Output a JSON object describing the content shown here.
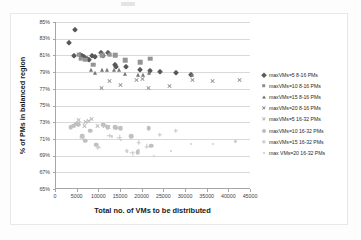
{
  "chart_data": {
    "type": "scatter",
    "title": "",
    "xlabel": "Total no. of VMs to be distributed",
    "ylabel": "% of PMs in balanced region",
    "xlim": [
      0,
      45000
    ],
    "ylim": [
      0.65,
      0.85
    ],
    "xticks": [
      "0",
      "5000",
      "10000",
      "15000",
      "20000",
      "25000",
      "30000",
      "35000",
      "40000",
      "45000"
    ],
    "yticks": [
      "65%",
      "67%",
      "69%",
      "71%",
      "73%",
      "75%",
      "77%",
      "79%",
      "81%",
      "83%",
      "85%"
    ],
    "grid": "horizontal",
    "legend_position": "right",
    "series": [
      {
        "name": "maxVMs=5 8-16 PMs",
        "marker": "diamond",
        "color": "#585858",
        "points": [
          [
            2900,
            82.5
          ],
          [
            4400,
            84.0
          ],
          [
            4100,
            80.9
          ],
          [
            5600,
            81.0
          ],
          [
            6000,
            80.9
          ],
          [
            6400,
            80.8
          ],
          [
            7100,
            80.6
          ],
          [
            7600,
            80.5
          ],
          [
            8400,
            80.9
          ],
          [
            9000,
            80.8
          ],
          [
            10400,
            81.3
          ],
          [
            10900,
            80.9
          ],
          [
            11900,
            81.3
          ],
          [
            13600,
            79.9
          ],
          [
            13900,
            79.6
          ],
          [
            16100,
            79.6
          ],
          [
            19400,
            79.3
          ],
          [
            21600,
            79.1
          ],
          [
            23900,
            79.0
          ],
          [
            27800,
            78.9
          ],
          [
            31200,
            78.7
          ]
        ]
      },
      {
        "name": "maxVMs=10 8-16 PMs",
        "marker": "square",
        "color": "#949494",
        "points": [
          [
            5200,
            81.1
          ],
          [
            5700,
            80.6
          ],
          [
            6800,
            80.5
          ],
          [
            8600,
            79.9
          ],
          [
            10600,
            81.0
          ],
          [
            12400,
            81.1
          ],
          [
            13700,
            81.0
          ],
          [
            16000,
            80.4
          ],
          [
            19400,
            80.2
          ],
          [
            21800,
            80.6
          ]
        ]
      },
      {
        "name": "maxVMs=15 8-16 PMs",
        "marker": "triangle",
        "color": "#767676",
        "points": [
          [
            8000,
            79.3
          ],
          [
            9100,
            78.9
          ],
          [
            10700,
            79.2
          ],
          [
            11800,
            79.2
          ],
          [
            13300,
            79.2
          ],
          [
            14600,
            79.2
          ],
          [
            16000,
            78.8
          ],
          [
            19000,
            78.7
          ],
          [
            20000,
            78.6
          ],
          [
            21500,
            78.9
          ],
          [
            31400,
            78.6
          ]
        ]
      },
      {
        "name": "maxVMs=20 8-16 PMs",
        "marker": "x",
        "color": "#8f8f8f",
        "points": [
          [
            10400,
            77.1
          ],
          [
            12400,
            77.9
          ],
          [
            14900,
            77.5
          ],
          [
            18500,
            78.1
          ],
          [
            20000,
            78.2
          ],
          [
            21400,
            77.1
          ],
          [
            26200,
            77.3
          ],
          [
            31400,
            78.1
          ],
          [
            36100,
            77.9
          ],
          [
            42300,
            78.0
          ]
        ]
      },
      {
        "name": "maxVMs=5 16-32 PMs",
        "marker": "x-light",
        "color": "#b9b9b9",
        "points": [
          [
            4100,
            72.5
          ],
          [
            5100,
            73.3
          ],
          [
            5300,
            72.9
          ],
          [
            6500,
            72.6
          ],
          [
            6800,
            73.0
          ],
          [
            7400,
            73.1
          ],
          [
            8100,
            73.4
          ],
          [
            9600,
            72.6
          ],
          [
            11200,
            72.5
          ],
          [
            12200,
            72.4
          ],
          [
            14100,
            72.3
          ]
        ]
      },
      {
        "name": "maxVMs=10 16-32 PMs",
        "marker": "circle",
        "color": "#c0c0c0",
        "points": [
          [
            3400,
            72.4
          ],
          [
            4100,
            72.6
          ],
          [
            4700,
            72.8
          ],
          [
            5100,
            72.7
          ],
          [
            6100,
            71.3
          ],
          [
            6700,
            70.8
          ],
          [
            7900,
            72.0
          ],
          [
            9300,
            70.3
          ],
          [
            10900,
            72.7
          ],
          [
            11900,
            72.4
          ],
          [
            13600,
            72.4
          ],
          [
            14900,
            72.3
          ],
          [
            17400,
            71.3
          ],
          [
            18900,
            69.4
          ],
          [
            21400,
            72.3
          ],
          [
            22000,
            70.2
          ]
        ]
      },
      {
        "name": "maxVMs=15 16-32 PMs",
        "marker": "plus",
        "color": "#c6c6c6",
        "points": [
          [
            6100,
            71.2
          ],
          [
            9700,
            70.0
          ],
          [
            12300,
            71.4
          ],
          [
            14600,
            71.2
          ],
          [
            16300,
            69.6
          ],
          [
            17600,
            69.3
          ],
          [
            19100,
            70.6
          ],
          [
            21000,
            70.1
          ],
          [
            23900,
            71.5
          ],
          [
            27600,
            72.0
          ]
        ]
      },
      {
        "name": "max VMs=20 16-32 PMs",
        "marker": "dot",
        "color": "#cdcdcd",
        "points": [
          [
            9800,
            70.0
          ],
          [
            12900,
            71.3
          ],
          [
            15000,
            70.9
          ],
          [
            16400,
            69.5
          ],
          [
            19000,
            69.7
          ],
          [
            22600,
            69.0
          ],
          [
            26600,
            69.6
          ],
          [
            31100,
            70.4
          ],
          [
            36300,
            70.4
          ],
          [
            41400,
            70.7
          ]
        ]
      }
    ]
  },
  "legend": {
    "items": [
      {
        "label": "maxVMs=5 8-16 PMs",
        "marker": "diamond"
      },
      {
        "label": "maxVMs=10 8-16 PMs",
        "marker": "square"
      },
      {
        "label": "maxVMs=15 8-16 PMs",
        "marker": "triangle"
      },
      {
        "label": "maxVMs=20 8-16 PMs",
        "marker": "x"
      },
      {
        "label": "maxVMs=5 16-32 PMs",
        "marker": "x-light"
      },
      {
        "label": "maxVMs=10 16-32 PMs",
        "marker": "circle"
      },
      {
        "label": "maxVMs=15 16-32 PMs",
        "marker": "plus"
      },
      {
        "label": "max VMs=20 16-32 PMs",
        "marker": "dot"
      }
    ]
  },
  "colors": {
    "gridline": "#d9d9d9",
    "axis": "#a6a6a6",
    "text": "#3f3f3f",
    "background": "#ffffff"
  }
}
